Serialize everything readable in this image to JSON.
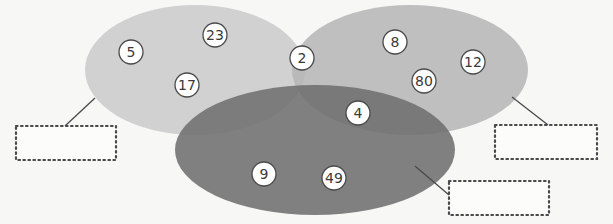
{
  "diagram": {
    "type": "venn",
    "background": "#f7f7f6",
    "sets": [
      {
        "id": "left",
        "cx": 195,
        "cy": 70,
        "rx": 110,
        "ry": 65,
        "color": "#cfcfcf",
        "opacity": 0.95
      },
      {
        "id": "right",
        "cx": 410,
        "cy": 70,
        "rx": 118,
        "ry": 65,
        "color": "#b5b5b5",
        "opacity": 0.85
      },
      {
        "id": "bottom",
        "cx": 315,
        "cy": 150,
        "rx": 140,
        "ry": 65,
        "color": "#6f6f6f",
        "opacity": 0.88
      }
    ],
    "numbers": [
      {
        "value": "5",
        "x": 131,
        "y": 52,
        "region": "left-only"
      },
      {
        "value": "23",
        "x": 215,
        "y": 35,
        "region": "left-only"
      },
      {
        "value": "17",
        "x": 187,
        "y": 85,
        "region": "left-only"
      },
      {
        "value": "2",
        "x": 302,
        "y": 58,
        "region": "left-right"
      },
      {
        "value": "8",
        "x": 395,
        "y": 42,
        "region": "right-only"
      },
      {
        "value": "12",
        "x": 473,
        "y": 62,
        "region": "right-only"
      },
      {
        "value": "80",
        "x": 424,
        "y": 81,
        "region": "right-only"
      },
      {
        "value": "4",
        "x": 358,
        "y": 113,
        "region": "right-bottom"
      },
      {
        "value": "9",
        "x": 264,
        "y": 174,
        "region": "bottom-only"
      },
      {
        "value": "49",
        "x": 334,
        "y": 178,
        "region": "bottom-only"
      }
    ],
    "label_boxes": [
      {
        "id": "left-label",
        "x": 16,
        "y": 126,
        "w": 100,
        "h": 34,
        "text": "",
        "line": {
          "x1": 95,
          "y1": 98,
          "x2": 65,
          "y2": 126
        }
      },
      {
        "id": "right-label",
        "x": 495,
        "y": 125,
        "w": 102,
        "h": 34,
        "text": "",
        "line": {
          "x1": 512,
          "y1": 97,
          "x2": 548,
          "y2": 125
        }
      },
      {
        "id": "bottom-label",
        "x": 449,
        "y": 181,
        "w": 100,
        "h": 34,
        "text": "",
        "line": {
          "x1": 415,
          "y1": 166,
          "x2": 449,
          "y2": 195
        }
      }
    ],
    "circle_style": {
      "r": 12,
      "fill": "#ffffff",
      "stroke": "#4a4a4a"
    },
    "box_style": {
      "stroke": "#4a4a4a"
    }
  }
}
